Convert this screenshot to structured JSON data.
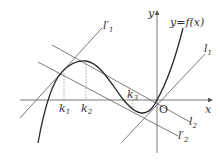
{
  "diagram": {
    "type": "function-graph-with-tangents",
    "colors": {
      "background": "#ffffff",
      "axis": "#555555",
      "curve": "#2a2a2a",
      "lines": "#6a6a6a",
      "guides": "#888888",
      "text": "#333333"
    },
    "axes": {
      "x_label": "x",
      "y_label": "y",
      "origin_label": "O"
    },
    "curve": {
      "label": "y=f(x)"
    },
    "lines": [
      {
        "id": "l1_prime",
        "label": "l",
        "sub": "1",
        "prime": "′"
      },
      {
        "id": "l1",
        "label": "l",
        "sub": "1",
        "prime": ""
      },
      {
        "id": "l2",
        "label": "l",
        "sub": "2",
        "prime": ""
      },
      {
        "id": "l2_prime",
        "label": "l",
        "sub": "2",
        "prime": "′"
      }
    ],
    "points": [
      {
        "id": "k1",
        "label": "k",
        "sub": "1"
      },
      {
        "id": "k2",
        "label": "k",
        "sub": "2"
      },
      {
        "id": "k3",
        "label": "k",
        "sub": "3"
      }
    ]
  }
}
